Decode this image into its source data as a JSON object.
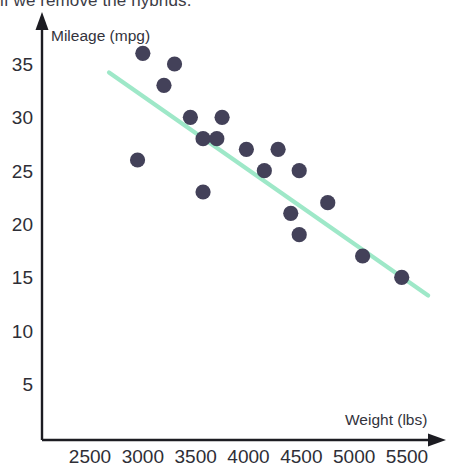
{
  "page": {
    "partial_top_text": "if we remove the hybrids."
  },
  "chart_data": {
    "type": "scatter",
    "title": "",
    "xlabel": "Weight (lbs)",
    "ylabel": "Mileage (mpg)",
    "xlim": [
      2200,
      5750
    ],
    "ylim": [
      0,
      38
    ],
    "xticks": [
      2500,
      3000,
      3500,
      4000,
      4500,
      5000,
      5500
    ],
    "xtick_labels": [
      "2500",
      "3000",
      "3500",
      "4000",
      "4500",
      "5000",
      "5500"
    ],
    "yticks": [
      5,
      10,
      15,
      20,
      25,
      30,
      35
    ],
    "ytick_labels": [
      "5",
      "10",
      "15",
      "20",
      "25",
      "30",
      "35"
    ],
    "grid": false,
    "legend": false,
    "point_color": "#434159",
    "trendline_color": "#9ee8c8",
    "axis_color": "#1c1c22",
    "points": [
      {
        "x": 3000,
        "y": 36
      },
      {
        "x": 3300,
        "y": 35
      },
      {
        "x": 3200,
        "y": 33
      },
      {
        "x": 2950,
        "y": 26
      },
      {
        "x": 3450,
        "y": 30
      },
      {
        "x": 3750,
        "y": 30
      },
      {
        "x": 3570,
        "y": 28
      },
      {
        "x": 3700,
        "y": 28
      },
      {
        "x": 3980,
        "y": 27
      },
      {
        "x": 4280,
        "y": 27
      },
      {
        "x": 3570,
        "y": 23
      },
      {
        "x": 4150,
        "y": 25
      },
      {
        "x": 4480,
        "y": 25
      },
      {
        "x": 4400,
        "y": 21
      },
      {
        "x": 4480,
        "y": 19
      },
      {
        "x": 4750,
        "y": 22
      },
      {
        "x": 5080,
        "y": 17
      },
      {
        "x": 5450,
        "y": 15
      }
    ],
    "trendline": {
      "type": "linear",
      "x_start": 2680,
      "y_start": 34.2,
      "x_end": 5700,
      "y_end": 13.3
    }
  }
}
